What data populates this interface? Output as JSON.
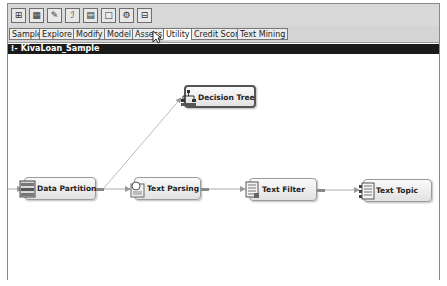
{
  "toolbar": {
    "icons": [
      {
        "name": "sample-icon",
        "glyph": "⊞"
      },
      {
        "name": "explore-icon",
        "glyph": "▦"
      },
      {
        "name": "modify-icon",
        "glyph": "✎"
      },
      {
        "name": "model-icon",
        "glyph": "ℐ"
      },
      {
        "name": "assess-icon",
        "glyph": "▤"
      },
      {
        "name": "document-icon",
        "glyph": "□"
      },
      {
        "name": "utility-icon",
        "glyph": "⚙"
      },
      {
        "name": "grid-icon",
        "glyph": "⊟"
      }
    ]
  },
  "tabs": [
    {
      "label": "Sample"
    },
    {
      "label": "Explore"
    },
    {
      "label": "Modify"
    },
    {
      "label": "Model"
    },
    {
      "label": "Assess"
    },
    {
      "label": "Utility"
    },
    {
      "label": "Credit Scoring"
    },
    {
      "label": "Text Mining"
    }
  ],
  "diagram": {
    "title": "KivaLoan_Sample",
    "nodes": [
      {
        "id": "data-partition",
        "label": "Data Partition"
      },
      {
        "id": "decision-tree",
        "label": "Decision Tree",
        "selected": true
      },
      {
        "id": "text-parsing",
        "label": "Text Parsing"
      },
      {
        "id": "text-filter",
        "label": "Text Filter"
      },
      {
        "id": "text-topic",
        "label": "Text Topic"
      }
    ]
  }
}
